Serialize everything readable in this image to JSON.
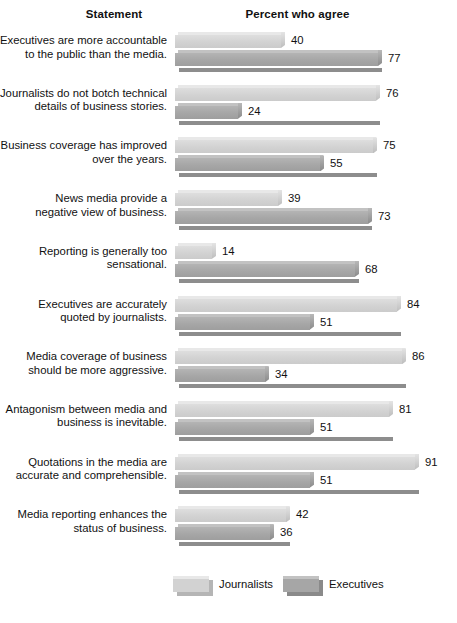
{
  "header": {
    "statement_label": "Statement",
    "percent_label": "Percent who agree"
  },
  "legend": {
    "items": [
      {
        "key": "journalists",
        "label": "Journalists",
        "color": "#d2d2d2"
      },
      {
        "key": "executives",
        "label": "Executives",
        "color": "#a6a6a6"
      }
    ]
  },
  "chart_data": {
    "type": "bar",
    "title": "Percent who agree",
    "xlabel": "Percent who agree",
    "ylabel": "Statement",
    "orientation": "horizontal",
    "grid": false,
    "legend_position": "bottom",
    "xlim": [
      0,
      100
    ],
    "categories": [
      "Executives are more accountable to the public than the media.",
      "Journalists do not botch technical details of business stories.",
      "Business coverage has improved over the years.",
      "News media provide a negative view of business.",
      "Reporting is generally too sensational.",
      "Executives are accurately quoted by journalists.",
      "Media coverage of business should be more aggressive.",
      "Antagonism between media and business is inevitable.",
      "Quotations in the media are accurate and comprehensible.",
      "Media reporting enhances the status of business."
    ],
    "category_lines": [
      [
        "Executives are more accountable",
        "to the public than the media."
      ],
      [
        "Journalists do not botch technical",
        "details of business stories."
      ],
      [
        "Business coverage has improved",
        "over the years."
      ],
      [
        "News media provide a",
        "negative view of business."
      ],
      [
        "Reporting is generally too",
        "sensational."
      ],
      [
        "Executives are accurately",
        "quoted by journalists."
      ],
      [
        "Media coverage of business",
        "should be more aggressive."
      ],
      [
        "Antagonism between media and",
        "business is inevitable."
      ],
      [
        "Quotations in the media are",
        "accurate and comprehensible."
      ],
      [
        "Media reporting enhances the",
        "status of business."
      ]
    ],
    "series": [
      {
        "name": "Journalists",
        "values": [
          40,
          76,
          75,
          39,
          14,
          84,
          86,
          81,
          91,
          42
        ]
      },
      {
        "name": "Executives",
        "values": [
          77,
          24,
          55,
          73,
          68,
          51,
          34,
          51,
          51,
          36
        ]
      }
    ]
  },
  "scale": {
    "origin_x": 175,
    "px_per_unit": 2.64,
    "plot_top": 30,
    "group_pitch": 52.7
  }
}
